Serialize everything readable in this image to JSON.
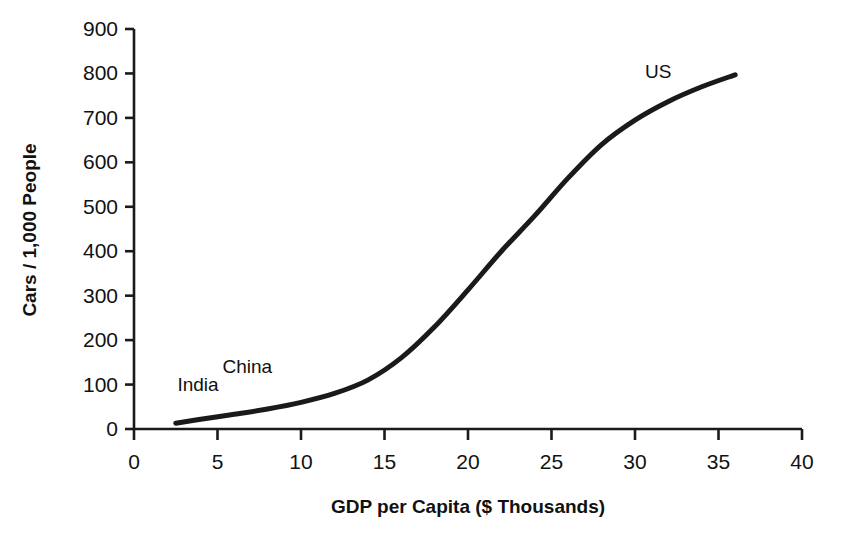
{
  "chart_data": {
    "type": "line",
    "title": "",
    "subtitle": "",
    "xlabel": "GDP per Capita ($ Thousands)",
    "ylabel": "Cars / 1,000 People",
    "xlim": [
      0,
      40
    ],
    "ylim": [
      0,
      900
    ],
    "xticks": [
      0,
      5,
      10,
      15,
      20,
      25,
      30,
      35,
      40
    ],
    "yticks": [
      0,
      100,
      200,
      300,
      400,
      500,
      600,
      700,
      800,
      900
    ],
    "xtick_labels": [
      "0",
      "5",
      "10",
      "15",
      "20",
      "25",
      "30",
      "35",
      "40"
    ],
    "ytick_labels": [
      "0",
      "100",
      "200",
      "300",
      "400",
      "500",
      "600",
      "700",
      "800",
      "900"
    ],
    "grid": false,
    "legend": "none",
    "line_color": "#1a1a1a",
    "line_width": 5,
    "series": [
      {
        "name": "Car ownership vs GDP",
        "x": [
          2.5,
          4,
          6,
          8,
          10,
          12,
          14,
          16,
          18,
          20,
          22,
          24,
          26,
          28,
          30,
          32,
          34,
          36
        ],
        "y": [
          13,
          22,
          33,
          45,
          60,
          80,
          110,
          160,
          230,
          313,
          400,
          480,
          565,
          640,
          695,
          737,
          770,
          797
        ]
      }
    ],
    "annotations": [
      {
        "text": "India",
        "x": 2.6,
        "y": 85,
        "anchor": "start"
      },
      {
        "text": "China",
        "x": 5.3,
        "y": 125,
        "anchor": "start"
      },
      {
        "text": "US",
        "x": 30.6,
        "y": 790,
        "anchor": "start"
      }
    ]
  },
  "axes": {
    "x_axis_label": "GDP per Capita ($ Thousands)",
    "y_axis_label": "Cars / 1,000 People"
  }
}
